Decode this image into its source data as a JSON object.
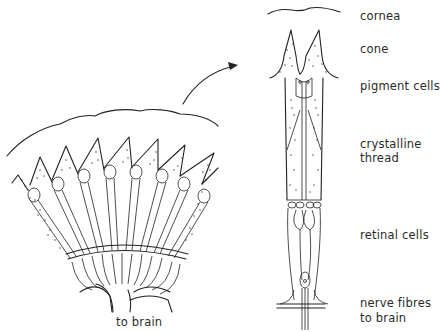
{
  "figure": {
    "left_panel": {
      "description": "section through compound eye showing ommatidia arranged radially",
      "bottom_label": "to brain"
    },
    "arrow": {
      "direction": "from left section to enlarged single ommatidium"
    },
    "right_panel": {
      "description": "enlarged single ommatidium",
      "labels": [
        {
          "id": "cornea",
          "text": "cornea"
        },
        {
          "id": "cone",
          "text": "cone"
        },
        {
          "id": "pigment",
          "text": "pigment cells"
        },
        {
          "id": "crystalline1",
          "text": "crystalline"
        },
        {
          "id": "crystalline2",
          "text": "thread"
        },
        {
          "id": "retinal",
          "text": "retinal cells"
        },
        {
          "id": "nerve1",
          "text": "nerve fibres"
        },
        {
          "id": "nerve2",
          "text": "to brain"
        }
      ]
    }
  }
}
